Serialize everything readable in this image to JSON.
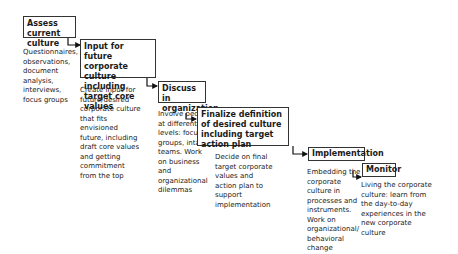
{
  "steps": [
    {
      "title": "Assess current culture",
      "description": "Questionnaires, observations, document analysis, interviews, focus groups"
    },
    {
      "title": "Input for future corporate culture including target core values",
      "description": "Create input for future/desired corporate culture that fits envisioned future, including draft core values and getting commitment from the top"
    },
    {
      "title": "Discuss in organization",
      "description": "Involve people at different levels: focus groups, intact teams. Work on business and organizational dilemmas"
    },
    {
      "title": "Finalize definition of desired culture including target action plan",
      "description": "Decide on final target corporate values and action plan to support implementation"
    },
    {
      "title": "Implementation",
      "description": "Embedding the corporate culture in processes and instruments. Work on organizational/ behavioral change"
    },
    {
      "title": "Monitor",
      "description": "Living the corporate culture: learn from the day-to-day experiences in the new corporate culture"
    }
  ]
}
